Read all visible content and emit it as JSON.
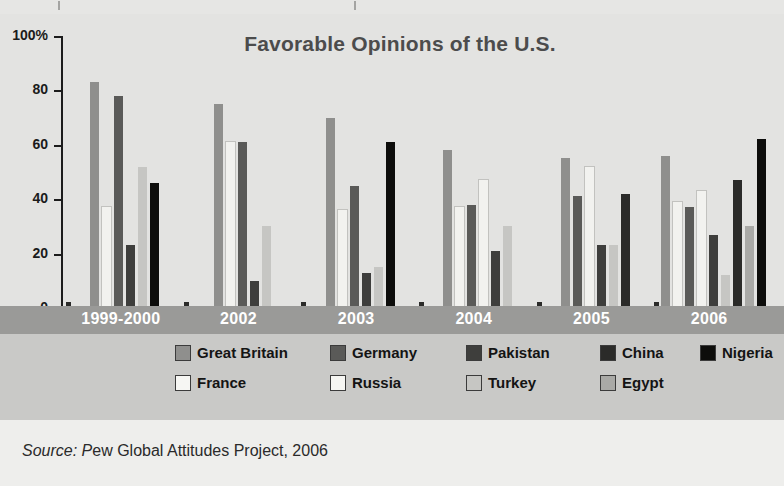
{
  "chart_data": {
    "type": "bar",
    "title": "Favorable Opinions of the U.S.",
    "xlabel": "",
    "ylabel": "",
    "ylim": [
      0,
      100
    ],
    "yticks": [
      "0",
      "20",
      "40",
      "60",
      "80",
      "100%"
    ],
    "grid": false,
    "legend_position": "bottom",
    "categories": [
      "1999-2000",
      "2002",
      "2003",
      "2004",
      "2005",
      "2006"
    ],
    "series": [
      {
        "name": "Great Britain",
        "color": "#8f8f8d",
        "values": [
          83,
          75,
          70,
          58,
          55,
          56
        ]
      },
      {
        "name": "France",
        "color": "#f2f2ef",
        "values": [
          37,
          61,
          36,
          37,
          null,
          39
        ]
      },
      {
        "name": "Germany",
        "color": "#5a5a58",
        "values": [
          78,
          61,
          45,
          38,
          41,
          37
        ]
      },
      {
        "name": "Russia",
        "color": "#f2f2ef",
        "values": [
          null,
          null,
          null,
          47,
          52,
          43
        ]
      },
      {
        "name": "Pakistan",
        "color": "#3e3e3c",
        "values": [
          23,
          10,
          13,
          21,
          23,
          27
        ]
      },
      {
        "name": "Turkey",
        "color": "#c6c6c3",
        "values": [
          52,
          30,
          15,
          30,
          23,
          12
        ]
      },
      {
        "name": "China",
        "color": "#2b2b29",
        "values": [
          null,
          null,
          null,
          null,
          42,
          47
        ]
      },
      {
        "name": "Egypt",
        "color": "#a9a9a6",
        "values": [
          null,
          null,
          null,
          null,
          null,
          30
        ]
      },
      {
        "name": "Nigeria",
        "color": "#0d0d0b",
        "values": [
          46,
          null,
          61,
          null,
          null,
          62
        ]
      }
    ]
  },
  "title": "Favorable Opinions of the U.S.",
  "axis": {
    "y_labels": [
      "100%",
      "80",
      "60",
      "40",
      "20",
      "0"
    ],
    "x_labels": [
      "1999-2000",
      "2002",
      "2003",
      "2004",
      "2005",
      "2006"
    ]
  },
  "legend": {
    "row1": [
      {
        "label": "Great Britain",
        "color": "#8f8f8d"
      },
      {
        "label": "Germany",
        "color": "#5a5a58"
      },
      {
        "label": "Pakistan",
        "color": "#3e3e3c"
      },
      {
        "label": "China",
        "color": "#2b2b29"
      },
      {
        "label": "Nigeria",
        "color": "#0d0d0b"
      }
    ],
    "row2": [
      {
        "label": "France",
        "color": "#f6f6f3"
      },
      {
        "label": "Russia",
        "color": "#f6f6f3"
      },
      {
        "label": "Turkey",
        "color": "#c6c6c3"
      },
      {
        "label": "Egypt",
        "color": "#a9a9a6"
      }
    ]
  },
  "source": {
    "prefix": "Source: P",
    "rest": "ew Global Attitudes Project, 2006",
    "full": "Source: Pew Global Attitudes Project, 2006"
  },
  "colors": {
    "background": "#ececeb",
    "plot_background": "#e3e3e1",
    "axis_band": "#9a9a98",
    "legend_background": "#c9c9c7",
    "source_background": "#eeeeec",
    "title_color": "#4c4c4c",
    "axis_text": "#1b1b1b"
  }
}
